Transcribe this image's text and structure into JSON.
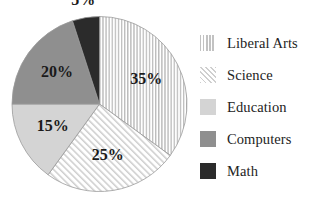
{
  "chart_data": {
    "type": "pie",
    "title": "",
    "subtitle": "",
    "xlabel": "",
    "ylabel": "",
    "grid": false,
    "legend_position": "right",
    "units": "percent",
    "total": 100,
    "start_angle_deg": 0,
    "direction": "clockwise",
    "categories": [
      "Liberal Arts",
      "Science",
      "Education",
      "Computers",
      "Math"
    ],
    "values": [
      35,
      25,
      15,
      20,
      5
    ],
    "data_labels": [
      "35%",
      "25%",
      "15%",
      "20%",
      "5%"
    ],
    "slices": [
      {
        "label": "Liberal Arts",
        "value": 35,
        "data_label": "35%",
        "pattern": "vertical-stripes",
        "color": "#ffffff",
        "pattern_color": "#c2c2c2",
        "start_deg": 0,
        "end_deg": 126,
        "label_inside": true
      },
      {
        "label": "Science",
        "value": 25,
        "data_label": "25%",
        "pattern": "diagonal-stripes",
        "color": "#ffffff",
        "pattern_color": "#cfcfcf",
        "start_deg": 126,
        "end_deg": 216,
        "label_inside": true
      },
      {
        "label": "Education",
        "value": 15,
        "data_label": "15%",
        "pattern": "solid",
        "color": "#d4d4d4",
        "pattern_color": "#d4d4d4",
        "start_deg": 216,
        "end_deg": 270,
        "label_inside": true
      },
      {
        "label": "Computers",
        "value": 20,
        "data_label": "20%",
        "pattern": "solid",
        "color": "#8f8f8f",
        "pattern_color": "#8f8f8f",
        "start_deg": 270,
        "end_deg": 342,
        "label_inside": true
      },
      {
        "label": "Math",
        "value": 5,
        "data_label": "5%",
        "pattern": "solid",
        "color": "#2b2b2b",
        "pattern_color": "#2b2b2b",
        "start_deg": 342,
        "end_deg": 360,
        "label_inside": false
      }
    ]
  },
  "legend": {
    "items": [
      {
        "label": "Liberal Arts",
        "swatch": "vertical-stripes"
      },
      {
        "label": "Science",
        "swatch": "diagonal-stripes"
      },
      {
        "label": "Education",
        "swatch": "solid-light"
      },
      {
        "label": "Computers",
        "swatch": "solid-medium"
      },
      {
        "label": "Math",
        "swatch": "solid-dark"
      }
    ]
  }
}
